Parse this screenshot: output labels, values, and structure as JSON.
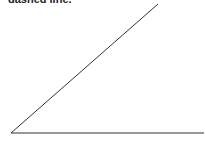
{
  "caption": "dashed line.",
  "diagram": {
    "type": "angle",
    "vertex": [
      11,
      133
    ],
    "ray1_end": [
      158,
      4
    ],
    "ray2_end": [
      204,
      133
    ],
    "stroke": "#333333"
  }
}
